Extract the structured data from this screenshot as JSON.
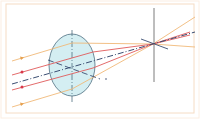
{
  "diagram": {
    "type": "optics-ray-diagram",
    "colors": {
      "frame": "#f5dcc4",
      "lens_fill": "#d4eef2",
      "lens_stroke": "#4f6f80",
      "orange_ray": "#f0b978",
      "red_ray": "#e05a5a",
      "axis": "#3b4e72",
      "focal_plane": "#6d6d6d",
      "arrow_red": "#d9384a",
      "arrow_orange": "#e6a04e"
    },
    "lens": {
      "cx": 72,
      "cy": 65,
      "rx": 23,
      "ry": 31
    },
    "optical_axis_vertical": {
      "x": 72,
      "y1": 30,
      "y2": 103
    },
    "focal_plane": {
      "x": 154,
      "y1": 8,
      "y2": 82
    },
    "focal_point": {
      "x": 153,
      "y": 44
    },
    "rays": [
      {
        "name": "orange-ray-top",
        "color": "orange",
        "start_y": 61
      },
      {
        "name": "red-ray-top",
        "color": "red",
        "start_y": 75
      },
      {
        "name": "central-axis",
        "color": "axis",
        "start_y": 84
      },
      {
        "name": "red-ray-bottom",
        "color": "red",
        "start_y": 90
      },
      {
        "name": "orange-ray-bottom",
        "color": "orange",
        "start_y": 107
      }
    ]
  }
}
